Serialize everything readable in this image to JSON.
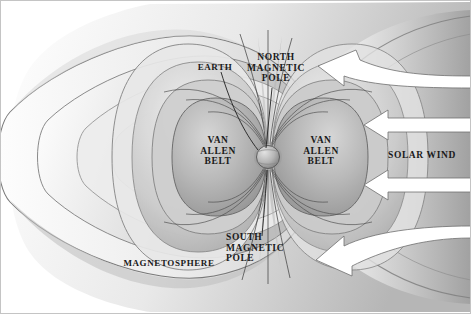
{
  "diagram": {
    "type": "scientific-illustration",
    "style": "grayscale halftone cutaway",
    "palette": {
      "background": "#ffffff",
      "field_light": "#f2f2f2",
      "field_mid": "#c9c9c9",
      "field_dark": "#8e8e8e",
      "field_darkest": "#6a6a6a",
      "outline": "#5f5f5f",
      "arrow_fill": "#ffffff",
      "arrow_edge": "#6d6d6d",
      "text": "#1a1a1a",
      "earth": "#b4b4b4"
    }
  },
  "labels": {
    "earth": "EARTH",
    "north_pole": "NORTH\nMAGNETIC\nPOLE",
    "south_pole": "SOUTH\nMAGNETIC\nPOLE",
    "van_allen_left": "VAN\nALLEN\nBELT",
    "van_allen_right": "VAN\nALLEN\nBELT",
    "magnetosphere": "MAGNETOSPHERE",
    "solar_wind": "SOLAR WIND"
  },
  "elements": {
    "earth_sphere": "earth-sphere",
    "magnetotail": "magnetotail-lobes",
    "bow_shock": "bow-shock-boundary",
    "field_lines": "magnetic-field-lines",
    "arrows": [
      {
        "name": "solar-wind-arrow-curved-top",
        "shape": "curved",
        "direction": "left-up"
      },
      {
        "name": "solar-wind-arrow-straight-upper",
        "shape": "straight",
        "direction": "left"
      },
      {
        "name": "solar-wind-arrow-straight-lower",
        "shape": "straight",
        "direction": "left"
      },
      {
        "name": "solar-wind-arrow-curved-bottom",
        "shape": "curved",
        "direction": "left-down"
      }
    ]
  }
}
